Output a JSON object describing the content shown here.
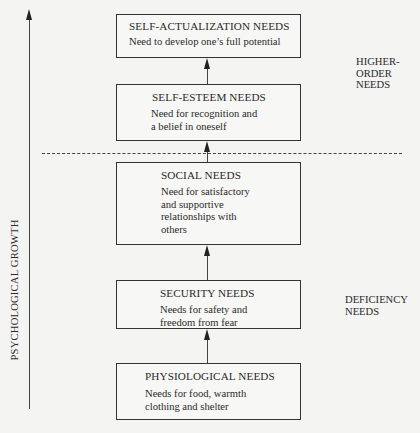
{
  "diagram": {
    "type": "hierarchy",
    "axis_label": "PSYCHOLOGICAL GROWTH",
    "side_labels": {
      "upper": "HIGHER-\nORDER\nNEEDS",
      "lower": "DEFICIENCY\nNEEDS"
    },
    "levels": [
      {
        "title": "SELF-ACTUALIZATION NEEDS",
        "description": "Need to develop one’s full potential"
      },
      {
        "title": "SELF-ESTEEM NEEDS",
        "description": "Need for recognition and\na belief in oneself"
      },
      {
        "title": "SOCIAL NEEDS",
        "description": "Need for satisfactory\nand supportive\nrelationships with\nothers"
      },
      {
        "title": "SECURITY NEEDS",
        "description": "Needs for safety and\nfreedom from fear"
      },
      {
        "title": "PHYSIOLOGICAL NEEDS",
        "description": "Needs for food, warmth\nclothing and shelter"
      }
    ],
    "divider": "dashed line between SELF-ESTEEM NEEDS and SOCIAL NEEDS",
    "colors": {
      "line": "#333333",
      "background": "#f4f4f2"
    }
  }
}
